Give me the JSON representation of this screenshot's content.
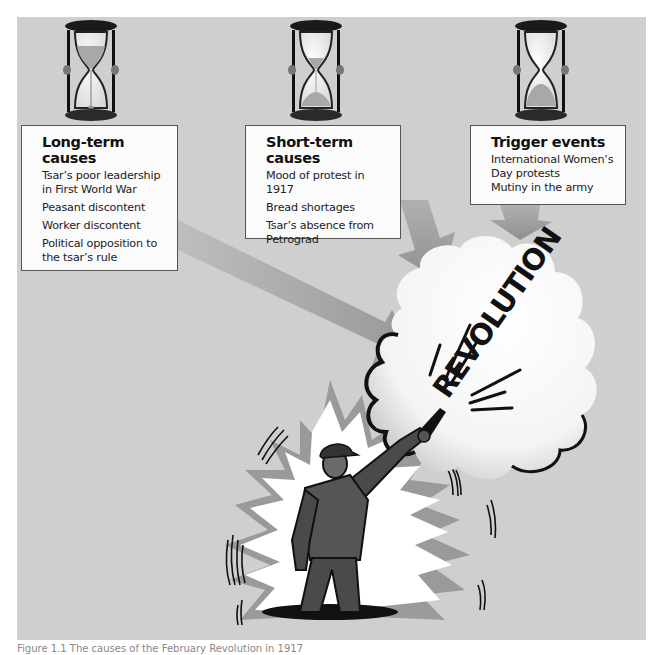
{
  "figure": {
    "caption": "Figure 1.1 The causes of the February Revolution in 1917",
    "colors": {
      "background": "#cfcfcf",
      "box_fill": "#fbfbfb",
      "box_border": "#555555",
      "arrow": "#9a9a9a",
      "ink": "#111111"
    }
  },
  "hourglasses": [
    {
      "name": "hourglass-long-term",
      "sand_state": "mostly-top"
    },
    {
      "name": "hourglass-short-term",
      "sand_state": "half"
    },
    {
      "name": "hourglass-trigger",
      "sand_state": "mostly-bottom"
    }
  ],
  "boxes": {
    "long_term": {
      "title": "Long-term causes",
      "items": [
        "Tsar’s poor leadership in First World War",
        "Peasant discontent",
        "Worker discontent",
        "Political opposition to the tsar’s rule"
      ]
    },
    "short_term": {
      "title": "Short-term causes",
      "items": [
        "Mood of protest in 1917",
        "Bread shortages",
        "Tsar’s absence from Petrograd"
      ]
    },
    "trigger": {
      "title": "Trigger events",
      "items": [
        "International Women’s Day protests",
        "Mutiny in the army"
      ]
    }
  },
  "center": {
    "label": "REVOLUTION",
    "figure_description": "worker firing pistol into cloud"
  }
}
